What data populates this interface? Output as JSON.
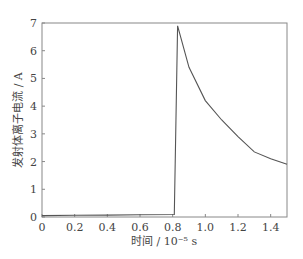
{
  "chart_data": {
    "type": "line",
    "title": "",
    "xlabel": "时间 / 10⁻⁵ s",
    "ylabel": "发射体离子电流 / A",
    "xlim": [
      0,
      1.5
    ],
    "ylim": [
      0,
      7
    ],
    "xticks": [
      0,
      0.2,
      0.4,
      0.6,
      0.8,
      1.0,
      1.2,
      1.4
    ],
    "xtick_labels": [
      "0",
      "0.2",
      "0.4",
      "0.6",
      "0.8",
      "1.0",
      "1.2",
      "1.4"
    ],
    "yticks": [
      0,
      1,
      2,
      3,
      4,
      5,
      6,
      7
    ],
    "ytick_labels": [
      "0",
      "1",
      "2",
      "3",
      "4",
      "5",
      "6",
      "7"
    ],
    "grid": false,
    "legend": null,
    "series": [
      {
        "name": "emitter ion current",
        "x": [
          0,
          0.2,
          0.4,
          0.6,
          0.81,
          0.83,
          0.9,
          1.0,
          1.1,
          1.2,
          1.3,
          1.4,
          1.5
        ],
        "y": [
          0.05,
          0.06,
          0.07,
          0.08,
          0.09,
          6.9,
          5.4,
          4.2,
          3.5,
          2.9,
          2.35,
          2.1,
          1.9
        ],
        "color": "#555555"
      }
    ]
  }
}
